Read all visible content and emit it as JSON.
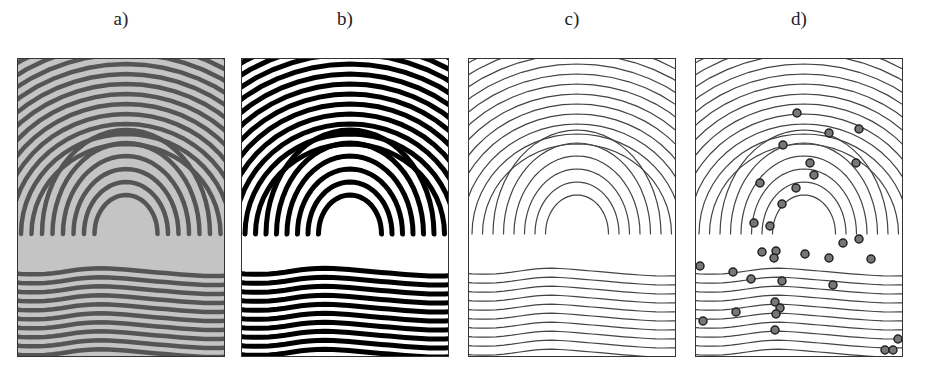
{
  "figure": {
    "panels": [
      {
        "id": "a",
        "label": "a)",
        "content": "grayscale fingerprint image"
      },
      {
        "id": "b",
        "label": "b)",
        "content": "binarized fingerprint image"
      },
      {
        "id": "c",
        "label": "c)",
        "content": "thinned ridge skeleton"
      },
      {
        "id": "d",
        "label": "d)",
        "content": "skeleton with detected minutiae"
      }
    ],
    "minutiae_points": [
      [
        101,
        54
      ],
      [
        133,
        74
      ],
      [
        163,
        70
      ],
      [
        87,
        86
      ],
      [
        114,
        104
      ],
      [
        160,
        104
      ],
      [
        118,
        116
      ],
      [
        100,
        129
      ],
      [
        64,
        124
      ],
      [
        86,
        145
      ],
      [
        58,
        164
      ],
      [
        74,
        167
      ],
      [
        147,
        184
      ],
      [
        163,
        180
      ],
      [
        66,
        193
      ],
      [
        80,
        192
      ],
      [
        78,
        199
      ],
      [
        109,
        195
      ],
      [
        133,
        199
      ],
      [
        175,
        200
      ],
      [
        4,
        207
      ],
      [
        37,
        213
      ],
      [
        55,
        220
      ],
      [
        86,
        222
      ],
      [
        137,
        226
      ],
      [
        79,
        243
      ],
      [
        84,
        249
      ],
      [
        80,
        255
      ],
      [
        40,
        253
      ],
      [
        7,
        262
      ],
      [
        79,
        271
      ],
      [
        202,
        280
      ],
      [
        189,
        291
      ],
      [
        197,
        291
      ]
    ]
  }
}
